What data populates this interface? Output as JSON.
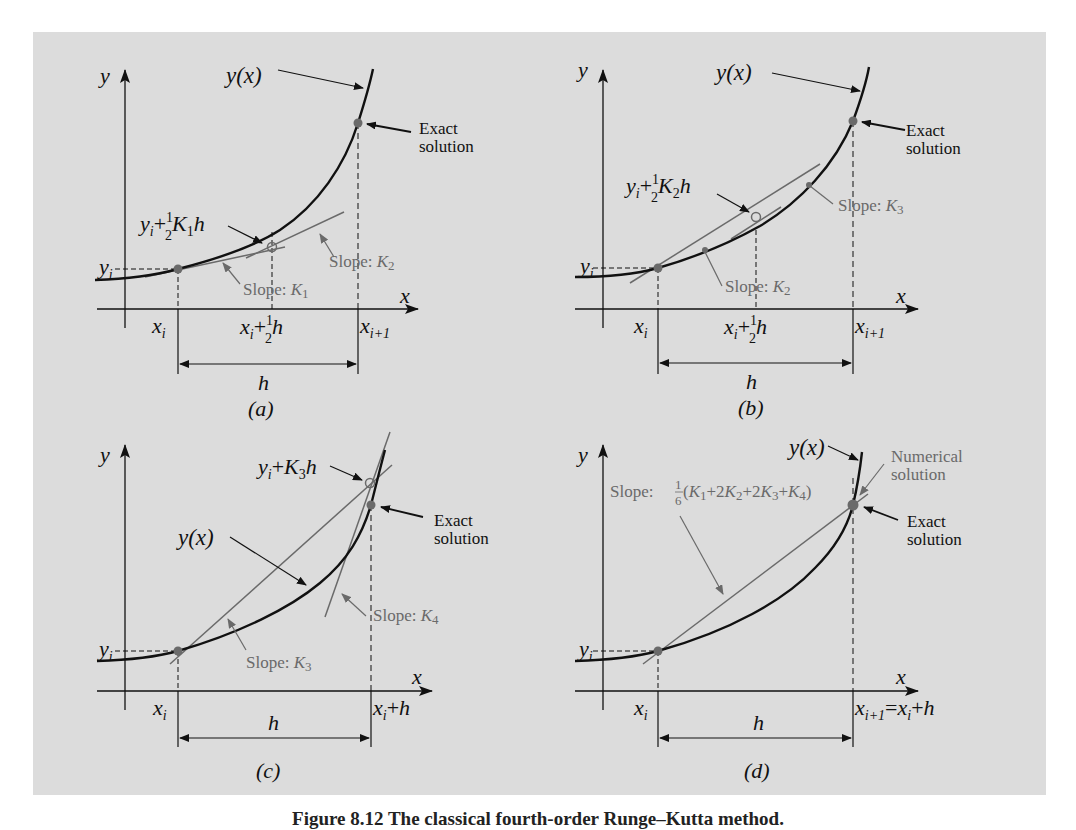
{
  "figure": {
    "caption": "Figure 8.12  The classical fourth-order Runge–Kutta method.",
    "background_color": "#dcdcdc",
    "curve_color": "#111111",
    "slope_line_color": "#6a6a6a",
    "panels": [
      {
        "id": "a",
        "label": "(a)",
        "axis_x": "x",
        "axis_y": "y",
        "curve_label": "y(x)",
        "yi_label": "yi",
        "xi_label": "xi",
        "mid_x_label": "xi + ½h",
        "end_x_label": "xi+1",
        "h_label": "h",
        "point_label": "yi + ½K1h",
        "exact_label_1": "Exact",
        "exact_label_2": "solution",
        "slope_labels": [
          "Slope: K1",
          "Slope: K2"
        ]
      },
      {
        "id": "b",
        "label": "(b)",
        "axis_x": "x",
        "axis_y": "y",
        "curve_label": "y(x)",
        "yi_label": "yi",
        "xi_label": "xi",
        "mid_x_label": "xi + ½h",
        "end_x_label": "xi+1",
        "h_label": "h",
        "point_label": "yi + ½K2h",
        "exact_label_1": "Exact",
        "exact_label_2": "solution",
        "slope_labels": [
          "Slope: K2",
          "Slope: K3"
        ]
      },
      {
        "id": "c",
        "label": "(c)",
        "axis_x": "x",
        "axis_y": "y",
        "curve_label": "y(x)",
        "yi_label": "yi",
        "xi_label": "xi",
        "end_x_label": "xi + h",
        "h_label": "h",
        "point_label": "yi + K3h",
        "exact_label_1": "Exact",
        "exact_label_2": "solution",
        "slope_labels": [
          "Slope: K3",
          "Slope: K4"
        ]
      },
      {
        "id": "d",
        "label": "(d)",
        "axis_x": "x",
        "axis_y": "y",
        "curve_label": "y(x)",
        "yi_label": "yi",
        "xi_label": "xi",
        "end_x_label": "xi+1 = xi + h",
        "h_label": "h",
        "slope_label_prefix": "Slope:",
        "slope_fraction": "1/6",
        "slope_expression": "(K1+2K2+2K3+K4)",
        "numerical_label_1": "Numerical",
        "numerical_label_2": "solution",
        "exact_label_1": "Exact",
        "exact_label_2": "solution"
      }
    ]
  }
}
